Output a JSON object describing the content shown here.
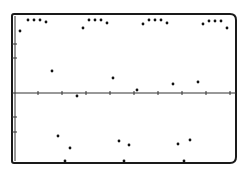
{
  "chart_data": {
    "type": "scatter",
    "title": "",
    "xlabel": "",
    "ylabel": "",
    "grid": false,
    "legend": null,
    "frame": {
      "left": 12,
      "top": 14,
      "right": 236,
      "bottom": 163
    },
    "axis_y_px": 93,
    "x_ticks_px": [
      38,
      62,
      86,
      110,
      134,
      158,
      182,
      206,
      230
    ],
    "y_ticks_px": [
      44,
      58,
      117,
      132
    ],
    "points_px": [
      [
        20,
        31
      ],
      [
        28,
        20
      ],
      [
        34,
        20
      ],
      [
        40,
        20
      ],
      [
        46,
        22
      ],
      [
        83,
        28
      ],
      [
        89,
        20
      ],
      [
        95,
        20
      ],
      [
        101,
        20
      ],
      [
        107,
        23
      ],
      [
        143,
        24
      ],
      [
        149,
        20
      ],
      [
        155,
        20
      ],
      [
        161,
        20
      ],
      [
        167,
        23
      ],
      [
        203,
        24
      ],
      [
        209,
        21
      ],
      [
        215,
        21
      ],
      [
        221,
        21
      ],
      [
        227,
        28
      ],
      [
        52,
        71
      ],
      [
        113,
        78
      ],
      [
        137,
        90
      ],
      [
        173,
        84
      ],
      [
        198,
        82
      ],
      [
        77,
        96
      ],
      [
        58,
        136
      ],
      [
        70,
        148
      ],
      [
        65,
        166
      ],
      [
        119,
        141
      ],
      [
        129,
        145
      ],
      [
        124,
        165
      ],
      [
        178,
        144
      ],
      [
        190,
        140
      ],
      [
        184,
        165
      ]
    ],
    "series": [
      {
        "name": "samples",
        "x": [
          0.25,
          0.58,
          0.83,
          1.08,
          1.33,
          1.38,
          1.58,
          1.71,
          1.79,
          2.04,
          2.13,
          2.29,
          2.46,
          2.71,
          2.96,
          3.08,
          3.21,
          3.25,
          3.42,
          3.5,
          3.67,
          3.92,
          4.04,
          4.17,
          4.29,
          4.42,
          4.58,
          4.67,
          4.75,
          4.92,
          5.04,
          5.29,
          5.54,
          5.79,
          6.04
        ],
        "y": [
          0.89,
          1.04,
          1.04,
          1.04,
          1.01,
          0.31,
          -0.61,
          -1.04,
          -0.79,
          0.93,
          1.04,
          1.04,
          1.04,
          1.0,
          0.21,
          -0.69,
          -1.03,
          -0.74,
          0.99,
          1.04,
          1.04,
          1.04,
          1.0,
          0.04,
          -0.73,
          -1.03,
          -0.67,
          0.13,
          0.99,
          1.03,
          1.03,
          1.03,
          0.94,
          0.16,
          0.74
        ]
      }
    ],
    "xlim": [
      0,
      9.3
    ],
    "ylim": [
      -1.07,
      1.13
    ]
  }
}
